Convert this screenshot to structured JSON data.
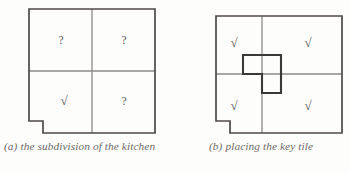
{
  "figure": {
    "panels": [
      {
        "id": "a",
        "caption": "(a) the subdivision of the kitchen",
        "cells": [
          {
            "label": "?",
            "kind": "question",
            "row": 0,
            "col": 0
          },
          {
            "label": "?",
            "kind": "question",
            "row": 0,
            "col": 1
          },
          {
            "label": "√",
            "kind": "check",
            "row": 1,
            "col": 0
          },
          {
            "label": "?",
            "kind": "question",
            "row": 1,
            "col": 1
          }
        ],
        "has_key_tile": false,
        "notch": "bottom-left"
      },
      {
        "id": "b",
        "caption": "(b) placing the key tile",
        "cells": [
          {
            "label": "√",
            "kind": "check",
            "row": 0,
            "col": 0
          },
          {
            "label": "√",
            "kind": "check",
            "row": 0,
            "col": 1
          },
          {
            "label": "√",
            "kind": "check",
            "row": 1,
            "col": 0
          },
          {
            "label": "√",
            "kind": "check",
            "row": 1,
            "col": 1
          }
        ],
        "has_key_tile": true,
        "key_tile_shape": "L-tromino",
        "notch": "bottom-left"
      }
    ]
  },
  "colors": {
    "outline": "#4d4a47",
    "gridline": "#8d8a86",
    "key_tile": "#3b3937",
    "glyph": "#54514e",
    "caption": "#6d6a66",
    "background": "#fdfdfc"
  }
}
